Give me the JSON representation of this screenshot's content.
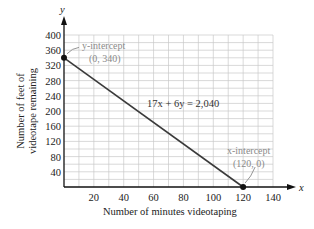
{
  "chart_data": {
    "type": "line",
    "title": "",
    "xlabel": "Number of minutes videotaping",
    "ylabel_line1": "Number of feet of",
    "ylabel_line2": "videotape remaining",
    "x_axis_name": "x",
    "y_axis_name": "y",
    "xlim": [
      0,
      140
    ],
    "ylim": [
      0,
      400
    ],
    "x_ticks": [
      20,
      40,
      60,
      80,
      100,
      120,
      140
    ],
    "y_ticks": [
      40,
      80,
      120,
      160,
      200,
      240,
      280,
      320,
      360,
      400
    ],
    "grid": true,
    "series": [
      {
        "name": "17x + 6y = 2,040",
        "x": [
          0,
          120
        ],
        "y": [
          340,
          0
        ]
      }
    ],
    "points": [
      {
        "x": 0,
        "y": 340,
        "label_line1": "y-intercept",
        "label_line2": "(0, 340)"
      },
      {
        "x": 120,
        "y": 0,
        "label_line1": "x-intercept",
        "label_line2": "(120, 0)"
      }
    ],
    "equation_label": "17x + 6y = 2,040",
    "colors": {
      "line": "#3a3a3a",
      "grid": "#c8c8c8",
      "annotation": "#8a8a8a",
      "axis": "#111111"
    }
  }
}
